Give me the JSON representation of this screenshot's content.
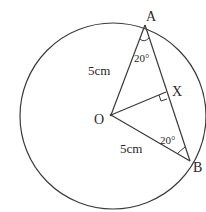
{
  "diagram": {
    "type": "circle-geometry",
    "circle": {
      "cx": 113,
      "cy": 116,
      "r": 93
    },
    "points": {
      "A": {
        "label": "A",
        "x": 145,
        "y": 25
      },
      "O": {
        "label": "O",
        "x": 111,
        "y": 115
      },
      "B": {
        "label": "B",
        "x": 190,
        "y": 161
      },
      "X": {
        "label": "X",
        "x": 167,
        "y": 92
      }
    },
    "labels": {
      "A": "A",
      "O": "O",
      "B": "B",
      "X": "X",
      "OA_length": "5cm",
      "OB_length": "5cm",
      "angle_A": "20°",
      "angle_B": "20°"
    },
    "colors": {
      "stroke": "#3a3a3a",
      "text": "#2a2a2a",
      "background": "#ffffff"
    }
  }
}
